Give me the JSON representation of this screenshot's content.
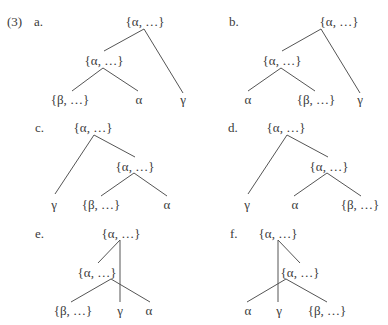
{
  "example_number": "(3)",
  "node_labels": {
    "alpha_set": "{α, …}",
    "beta_set": "{β, …}",
    "alpha": "α",
    "gamma": "γ"
  },
  "line_color": "#555555",
  "trees": [
    {
      "id": "a",
      "label": "a.",
      "label_pos": [
        34,
        22
      ],
      "nodes": [
        {
          "name": "root",
          "text": "{α, …}",
          "x": 145,
          "y": 22
        },
        {
          "name": "mid",
          "text": "{α, …}",
          "x": 104,
          "y": 61
        },
        {
          "name": "leaf-1",
          "text": "{β, …}",
          "x": 70,
          "y": 100
        },
        {
          "name": "leaf-2",
          "text": "α",
          "x": 139,
          "y": 100
        },
        {
          "name": "leaf-3",
          "text": "γ",
          "x": 183,
          "y": 100
        }
      ],
      "edges": [
        [
          144,
          29,
          104,
          51
        ],
        [
          144,
          29,
          183,
          93
        ],
        [
          103,
          68,
          72,
          91
        ],
        [
          103,
          68,
          138,
          91
        ]
      ]
    },
    {
      "id": "b",
      "label": "b.",
      "label_pos": [
        229,
        22
      ],
      "nodes": [
        {
          "name": "root",
          "text": "{α, …}",
          "x": 339,
          "y": 22
        },
        {
          "name": "mid",
          "text": "{α, …}",
          "x": 282,
          "y": 61
        },
        {
          "name": "leaf-1",
          "text": "α",
          "x": 248,
          "y": 100
        },
        {
          "name": "leaf-2",
          "text": "{β, …}",
          "x": 316,
          "y": 100
        },
        {
          "name": "leaf-3",
          "text": "γ",
          "x": 360,
          "y": 100
        }
      ],
      "edges": [
        [
          321,
          29,
          282,
          51
        ],
        [
          321,
          29,
          360,
          93
        ],
        [
          281,
          68,
          248,
          91
        ],
        [
          281,
          68,
          315,
          91
        ]
      ]
    },
    {
      "id": "c",
      "label": "c.",
      "label_pos": [
        35,
        128
      ],
      "nodes": [
        {
          "name": "root",
          "text": "{α, …}",
          "x": 93,
          "y": 128
        },
        {
          "name": "mid",
          "text": "{α, …}",
          "x": 135,
          "y": 167
        },
        {
          "name": "leaf-1",
          "text": "γ",
          "x": 54,
          "y": 205
        },
        {
          "name": "leaf-2",
          "text": "{β, …}",
          "x": 101,
          "y": 205
        },
        {
          "name": "leaf-3",
          "text": "α",
          "x": 167,
          "y": 205
        }
      ],
      "edges": [
        [
          94,
          135,
          135,
          157
        ],
        [
          94,
          135,
          55,
          194
        ],
        [
          134,
          173,
          101,
          196
        ],
        [
          134,
          173,
          167,
          196
        ]
      ]
    },
    {
      "id": "d",
      "label": "d.",
      "label_pos": [
        228,
        128
      ],
      "nodes": [
        {
          "name": "root",
          "text": "{α, …}",
          "x": 286,
          "y": 128
        },
        {
          "name": "mid",
          "text": "{α, …}",
          "x": 329,
          "y": 167
        },
        {
          "name": "leaf-1",
          "text": "γ",
          "x": 247,
          "y": 205
        },
        {
          "name": "leaf-2",
          "text": "α",
          "x": 295,
          "y": 205
        },
        {
          "name": "leaf-3",
          "text": "{β, …}",
          "x": 360,
          "y": 205
        }
      ],
      "edges": [
        [
          287,
          135,
          328,
          157
        ],
        [
          287,
          135,
          248,
          194
        ],
        [
          327,
          173,
          294,
          196
        ],
        [
          327,
          173,
          361,
          196
        ]
      ]
    },
    {
      "id": "e",
      "label": "e.",
      "label_pos": [
        35,
        234
      ],
      "nodes": [
        {
          "name": "root",
          "text": "{α, …}",
          "x": 121,
          "y": 234
        },
        {
          "name": "mid",
          "text": "{α, …}",
          "x": 97,
          "y": 273
        },
        {
          "name": "leaf-1",
          "text": "{β, …}",
          "x": 73,
          "y": 311
        },
        {
          "name": "leaf-2",
          "text": "γ",
          "x": 120,
          "y": 311
        },
        {
          "name": "leaf-3",
          "text": "α",
          "x": 149,
          "y": 311
        }
      ],
      "edges": [
        [
          120,
          240,
          98,
          263
        ],
        [
          120,
          240,
          120,
          302
        ],
        [
          111,
          279,
          71,
          302
        ],
        [
          111,
          279,
          150,
          302
        ]
      ]
    },
    {
      "id": "f",
      "label": "f.",
      "label_pos": [
        230,
        234
      ],
      "nodes": [
        {
          "name": "root",
          "text": "{α, …}",
          "x": 278,
          "y": 234
        },
        {
          "name": "mid",
          "text": "{α, …}",
          "x": 300,
          "y": 273
        },
        {
          "name": "leaf-1",
          "text": "α",
          "x": 248,
          "y": 311
        },
        {
          "name": "leaf-2",
          "text": "γ",
          "x": 279,
          "y": 311
        },
        {
          "name": "leaf-3",
          "text": "{β, …}",
          "x": 327,
          "y": 311
        }
      ],
      "edges": [
        [
          278,
          240,
          300,
          263
        ],
        [
          278,
          240,
          278,
          302
        ],
        [
          286,
          279,
          247,
          302
        ],
        [
          286,
          279,
          327,
          302
        ]
      ]
    }
  ]
}
